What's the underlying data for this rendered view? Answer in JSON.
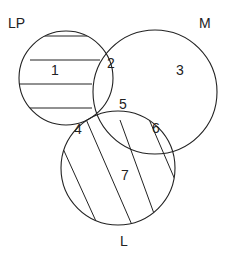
{
  "diagram": {
    "type": "venn",
    "sets": [
      {
        "id": "LP",
        "label": "LP",
        "hatch": "horizontal"
      },
      {
        "id": "M",
        "label": "M",
        "hatch": "none"
      },
      {
        "id": "L",
        "label": "L",
        "hatch": "diagonal"
      }
    ],
    "regions": [
      {
        "number": "1",
        "sets": [
          "LP"
        ]
      },
      {
        "number": "2",
        "sets": [
          "LP",
          "M"
        ]
      },
      {
        "number": "3",
        "sets": [
          "M"
        ]
      },
      {
        "number": "4",
        "sets": [
          "LP",
          "L"
        ]
      },
      {
        "number": "5",
        "sets": [
          "LP",
          "M",
          "L"
        ]
      },
      {
        "number": "6",
        "sets": [
          "M",
          "L"
        ]
      },
      {
        "number": "7",
        "sets": [
          "L"
        ]
      }
    ],
    "colors": {
      "stroke": "#222222",
      "background": "#ffffff"
    }
  }
}
